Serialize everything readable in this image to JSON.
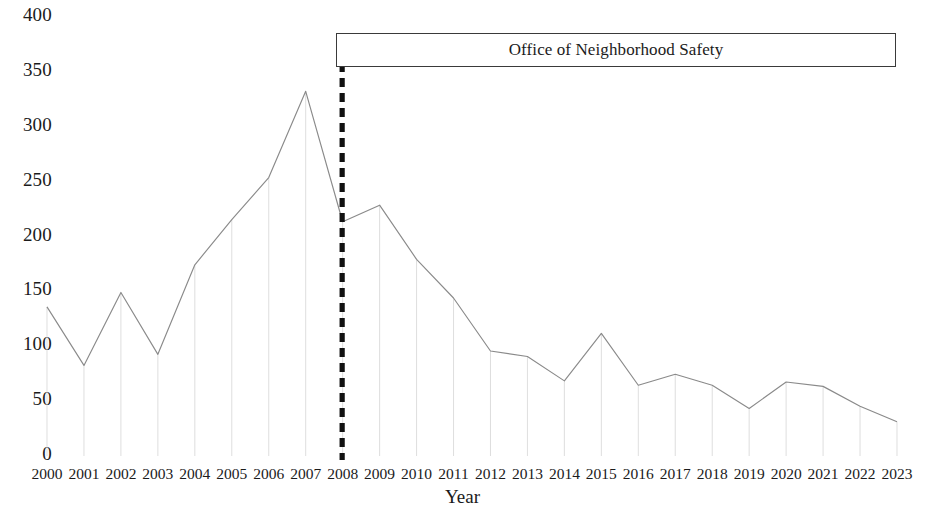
{
  "chart_data": {
    "type": "line",
    "title": "",
    "xlabel": "Year",
    "ylabel": "",
    "categories": [
      "2000",
      "2001",
      "2002",
      "2003",
      "2004",
      "2005",
      "2006",
      "2007",
      "2008",
      "2009",
      "2010",
      "2011",
      "2012",
      "2013",
      "2014",
      "2015",
      "2016",
      "2017",
      "2018",
      "2019",
      "2020",
      "2021",
      "2022",
      "2023"
    ],
    "values": [
      135,
      82,
      148,
      92,
      173,
      214,
      252,
      330,
      212,
      227,
      178,
      143,
      95,
      90,
      68,
      111,
      64,
      74,
      64,
      43,
      67,
      63,
      45,
      31
    ],
    "series": [
      {
        "name": "Annual count",
        "values": [
          135,
          82,
          148,
          92,
          173,
          214,
          252,
          330,
          212,
          227,
          178,
          143,
          95,
          90,
          68,
          111,
          64,
          74,
          64,
          43,
          67,
          63,
          45,
          31
        ]
      }
    ],
    "ylim": [
      0,
      400
    ],
    "ytick_labels": [
      "0",
      "50",
      "100",
      "150",
      "200",
      "250",
      "300",
      "350",
      "400"
    ],
    "ytick_values": [
      0,
      50,
      100,
      150,
      200,
      250,
      300,
      350,
      400
    ],
    "grid": "vertical-droplines",
    "legend": "none",
    "line_color": "#8a8a8a",
    "annotations": [
      {
        "id": "ons-period",
        "label": "Office of Neighborhood Safety",
        "type": "box-with-marker-line",
        "start_year": "2008",
        "end_year": "2023",
        "marker_line_style": "dashed",
        "marker_line_color": "#111111",
        "box_border_color": "#3a3a3a"
      }
    ]
  },
  "axis": {
    "x_title": "Year"
  }
}
